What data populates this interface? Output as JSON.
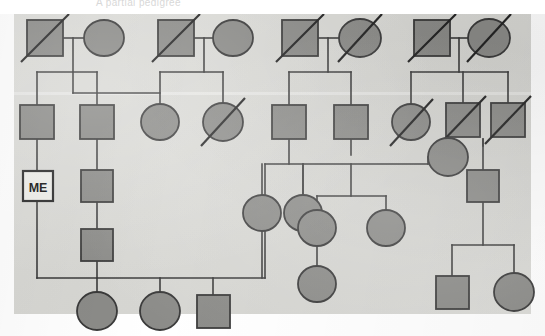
{
  "figure": {
    "type": "pedigree-chart",
    "title": "",
    "faint_caption": "A partial pedigree",
    "canvas": {
      "width": 545,
      "height": 336
    },
    "paper": {
      "x": 14,
      "y": 14,
      "width": 517,
      "height": 300,
      "fill": "#d9d9d5"
    },
    "colors": {
      "background": "#ffffff",
      "paper": "#d9d9d5",
      "affected_fill": "#8b8b88",
      "unaffected_fill": "#eeeeea",
      "stroke": "#3a3a3a",
      "deceased_slash": "#2a2a2a",
      "proband_label": "#111111"
    },
    "legend": {
      "square": "male",
      "circle": "female",
      "filled": "affected / shaded individual",
      "diagonal_slash": "deceased",
      "open_box_with_label": "proband"
    }
  },
  "proband": {
    "label": "ME",
    "shape": "square",
    "filled": false,
    "x": 38,
    "y": 186,
    "size": 30
  },
  "generations": [
    {
      "name": "generation-I",
      "row_y": 38,
      "individuals": [
        {
          "id": "I-1",
          "shape": "square",
          "filled": true,
          "deceased": true,
          "cx": 45,
          "cy": 38,
          "size": 36
        },
        {
          "id": "I-2",
          "shape": "circle",
          "filled": true,
          "deceased": false,
          "cx": 104,
          "cy": 38,
          "rx": 20,
          "ry": 18
        },
        {
          "id": "I-3",
          "shape": "square",
          "filled": true,
          "deceased": true,
          "cx": 176,
          "cy": 38,
          "size": 36
        },
        {
          "id": "I-4",
          "shape": "circle",
          "filled": true,
          "deceased": false,
          "cx": 233,
          "cy": 38,
          "rx": 20,
          "ry": 18
        },
        {
          "id": "I-5",
          "shape": "square",
          "filled": true,
          "deceased": true,
          "cx": 300,
          "cy": 38,
          "size": 36
        },
        {
          "id": "I-6",
          "shape": "circle",
          "filled": true,
          "deceased": true,
          "cx": 360,
          "cy": 38,
          "rx": 21,
          "ry": 19
        },
        {
          "id": "I-7",
          "shape": "square",
          "filled": true,
          "deceased": true,
          "cx": 432,
          "cy": 38,
          "size": 36
        },
        {
          "id": "I-8",
          "shape": "circle",
          "filled": true,
          "deceased": true,
          "cx": 489,
          "cy": 38,
          "rx": 21,
          "ry": 19
        }
      ]
    },
    {
      "name": "generation-II",
      "row_y": 122,
      "individuals": [
        {
          "id": "II-1",
          "shape": "square",
          "filled": true,
          "deceased": false,
          "cx": 37,
          "cy": 122,
          "size": 34
        },
        {
          "id": "II-2",
          "shape": "square",
          "filled": true,
          "deceased": false,
          "cx": 97,
          "cy": 122,
          "size": 34
        },
        {
          "id": "II-3",
          "shape": "circle",
          "filled": true,
          "deceased": false,
          "cx": 160,
          "cy": 122,
          "rx": 19,
          "ry": 18
        },
        {
          "id": "II-4",
          "shape": "circle",
          "filled": true,
          "deceased": true,
          "cx": 223,
          "cy": 122,
          "rx": 20,
          "ry": 19
        },
        {
          "id": "II-5",
          "shape": "square",
          "filled": true,
          "deceased": false,
          "cx": 289,
          "cy": 122,
          "size": 34
        },
        {
          "id": "II-6",
          "shape": "square",
          "filled": true,
          "deceased": false,
          "cx": 351,
          "cy": 122,
          "size": 34
        },
        {
          "id": "II-7",
          "shape": "circle",
          "filled": true,
          "deceased": true,
          "cx": 411,
          "cy": 122,
          "rx": 19,
          "ry": 18
        },
        {
          "id": "II-8",
          "shape": "square",
          "filled": true,
          "deceased": true,
          "cx": 463,
          "cy": 120,
          "size": 34
        },
        {
          "id": "II-9",
          "shape": "square",
          "filled": true,
          "deceased": true,
          "cx": 508,
          "cy": 120,
          "size": 34
        },
        {
          "id": "II-10",
          "shape": "circle",
          "filled": true,
          "deceased": false,
          "cx": 448,
          "cy": 157,
          "rx": 20,
          "ry": 19
        }
      ]
    },
    {
      "name": "generation-III",
      "row_y": 186,
      "individuals": [
        {
          "id": "III-1",
          "shape": "square",
          "filled": false,
          "deceased": false,
          "cx": 38,
          "cy": 186,
          "size": 30,
          "label": "ME"
        },
        {
          "id": "III-2",
          "shape": "square",
          "filled": true,
          "deceased": false,
          "cx": 97,
          "cy": 186,
          "size": 32
        },
        {
          "id": "III-3",
          "shape": "square",
          "filled": true,
          "deceased": false,
          "cx": 483,
          "cy": 186,
          "size": 32
        },
        {
          "id": "III-4",
          "shape": "circle",
          "filled": true,
          "deceased": false,
          "cx": 262,
          "cy": 213,
          "rx": 19,
          "ry": 18
        },
        {
          "id": "III-5",
          "shape": "circle",
          "filled": true,
          "deceased": false,
          "cx": 303,
          "cy": 213,
          "rx": 19,
          "ry": 18
        },
        {
          "id": "III-6",
          "shape": "circle",
          "filled": true,
          "deceased": false,
          "cx": 343,
          "cy": 228,
          "rx": 19,
          "ry": 18
        },
        {
          "id": "III-7",
          "shape": "circle",
          "filled": true,
          "deceased": false,
          "cx": 401,
          "cy": 228,
          "rx": 19,
          "ry": 18
        },
        {
          "id": "III-8",
          "shape": "square",
          "filled": true,
          "deceased": false,
          "cx": 97,
          "cy": 245,
          "size": 32
        }
      ]
    },
    {
      "name": "generation-IV",
      "row_y": 311,
      "individuals": [
        {
          "id": "IV-1",
          "shape": "circle",
          "filled": true,
          "deceased": false,
          "cx": 97,
          "cy": 311,
          "rx": 20,
          "ry": 19
        },
        {
          "id": "IV-2",
          "shape": "circle",
          "filled": true,
          "deceased": false,
          "cx": 160,
          "cy": 311,
          "rx": 20,
          "ry": 19
        },
        {
          "id": "IV-3",
          "shape": "square",
          "filled": true,
          "deceased": false,
          "cx": 213,
          "cy": 311,
          "size": 33
        },
        {
          "id": "IV-4",
          "shape": "circle",
          "filled": true,
          "deceased": false,
          "cx": 343,
          "cy": 283,
          "rx": 19,
          "ry": 18
        },
        {
          "id": "IV-5",
          "shape": "square",
          "filled": true,
          "deceased": false,
          "cx": 452,
          "cy": 292,
          "size": 33
        },
        {
          "id": "IV-6",
          "shape": "circle",
          "filled": true,
          "deceased": false,
          "cx": 514,
          "cy": 292,
          "rx": 20,
          "ry": 19
        }
      ]
    }
  ],
  "counts": {
    "total_individuals": 32,
    "males": 16,
    "females": 16,
    "deceased": 9,
    "generations": 4
  }
}
